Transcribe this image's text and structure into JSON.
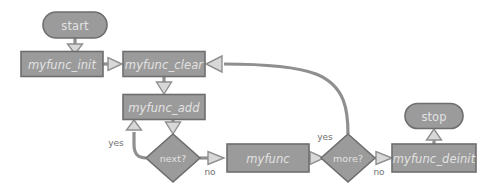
{
  "diagram": {
    "type": "flowchart",
    "background_color": "#ffffff",
    "node_fill_color": "#9b9b9b",
    "node_border_color": "#6e6e6e",
    "node_text_color": "#e2e2e2",
    "edge_color": "#8f8f8f",
    "edge_label_color": "#707070",
    "arrow_fill_color": "#d8d8d8",
    "nodes": [
      {
        "id": "start",
        "label": "start",
        "shape": "terminal",
        "cx": 75,
        "cy": 25,
        "w": 64,
        "h": 26
      },
      {
        "id": "myfunc_init",
        "label": "myfunc_init",
        "shape": "process",
        "cx": 62,
        "cy": 64,
        "w": 82,
        "h": 25
      },
      {
        "id": "myfunc_clear",
        "label": "myfunc_clear",
        "shape": "process",
        "cx": 164,
        "cy": 64,
        "w": 82,
        "h": 25
      },
      {
        "id": "myfunc_add",
        "label": "myfunc_add",
        "shape": "process",
        "cx": 164,
        "cy": 107,
        "w": 82,
        "h": 25
      },
      {
        "id": "next",
        "label": "next?",
        "shape": "decision",
        "cx": 173,
        "cy": 158,
        "w": 54,
        "h": 48
      },
      {
        "id": "myfunc",
        "label": "myfunc",
        "shape": "process",
        "cx": 268,
        "cy": 158,
        "w": 82,
        "h": 28
      },
      {
        "id": "more",
        "label": "more?",
        "shape": "decision",
        "cx": 348,
        "cy": 158,
        "w": 54,
        "h": 48
      },
      {
        "id": "myfunc_deinit",
        "label": "myfunc_deinit",
        "shape": "process",
        "cx": 434,
        "cy": 158,
        "w": 84,
        "h": 28
      },
      {
        "id": "stop",
        "label": "stop",
        "shape": "terminal",
        "cx": 434,
        "cy": 116,
        "w": 58,
        "h": 25
      }
    ],
    "edges": [
      {
        "id": "e-start-init",
        "from": "start",
        "to": "myfunc_init",
        "label": ""
      },
      {
        "id": "e-init-clear",
        "from": "myfunc_init",
        "to": "myfunc_clear",
        "label": ""
      },
      {
        "id": "e-clear-add",
        "from": "myfunc_clear",
        "to": "myfunc_add",
        "label": ""
      },
      {
        "id": "e-add-next",
        "from": "myfunc_add",
        "to": "next",
        "label": ""
      },
      {
        "id": "e-next-add-yes",
        "from": "next",
        "to": "myfunc_add",
        "label": "yes"
      },
      {
        "id": "e-next-myfunc-no",
        "from": "next",
        "to": "myfunc",
        "label": "no"
      },
      {
        "id": "e-myfunc-more",
        "from": "myfunc",
        "to": "more",
        "label": ""
      },
      {
        "id": "e-more-clear-yes",
        "from": "more",
        "to": "myfunc_clear",
        "label": "yes"
      },
      {
        "id": "e-more-deinit-no",
        "from": "more",
        "to": "myfunc_deinit",
        "label": "no"
      },
      {
        "id": "e-deinit-stop",
        "from": "myfunc_deinit",
        "to": "stop",
        "label": ""
      }
    ],
    "edge_labels": {
      "next_yes": "yes",
      "next_no": "no",
      "more_yes": "yes",
      "more_no": "no"
    }
  }
}
